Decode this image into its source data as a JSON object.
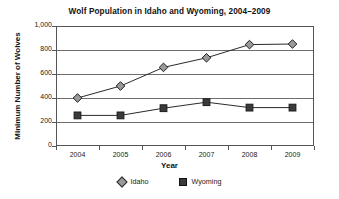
{
  "chart_data": {
    "type": "line",
    "title": "Wolf Population in Idaho and Wyoming, 2004–2009",
    "xlabel": "Year",
    "ylabel": "Minimum Number of Wolves",
    "categories": [
      "2004",
      "2005",
      "2006",
      "2007",
      "2008",
      "2009"
    ],
    "ylim": [
      0,
      1000
    ],
    "yticks": [
      0,
      200,
      400,
      600,
      800,
      1000
    ],
    "ytick_labels": [
      "0",
      "200",
      "400",
      "600",
      "800",
      "1,000"
    ],
    "grid": true,
    "legend_position": "bottom",
    "series": [
      {
        "name": "Idaho",
        "marker": "diamond",
        "marker_color": "#9a9a9a",
        "line_color": "#2b2b2b",
        "values": [
          400,
          500,
          655,
          735,
          845,
          850
        ]
      },
      {
        "name": "Wyoming",
        "marker": "square",
        "marker_color": "#3a3a3a",
        "line_color": "#2b2b2b",
        "values": [
          255,
          255,
          315,
          365,
          320,
          320
        ]
      }
    ]
  },
  "legend": {
    "items": [
      {
        "label": "Idaho",
        "marker": "diamond-marker-icon"
      },
      {
        "label": "Wyoming",
        "marker": "square-marker-icon"
      }
    ]
  }
}
